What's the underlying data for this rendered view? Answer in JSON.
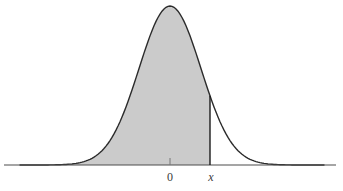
{
  "figure": {
    "width": 343,
    "height": 191,
    "background": "#ffffff"
  },
  "chart_data": {
    "type": "area",
    "title": "",
    "curve": "normal-density",
    "x_axis": {
      "tick_labels": [
        "0",
        "x"
      ],
      "axis_line_shown": true,
      "y_axis_shown": false,
      "grid": false
    },
    "shaded_region": {
      "from": "-infinity",
      "to": "x",
      "fill": "#cbcbcb"
    },
    "annotations": [
      {
        "label": "0",
        "role": "mean-tick-label"
      },
      {
        "label": "x",
        "role": "cutoff-label",
        "marker": "vertical-line-to-curve"
      }
    ],
    "style": {
      "curve_stroke": "#2b2b2b",
      "curve_stroke_width": 1.4,
      "axis_stroke": "#4d4d4d",
      "axis_stroke_width": 1.1,
      "tick_stroke": "#777777",
      "cutoff_stroke": "#1c1c1c",
      "cutoff_stroke_width": 1.4,
      "label_color": "#3a3a3a"
    },
    "geometry_px": {
      "mean_x": 170,
      "sigma": 31,
      "peak_top_y": 6,
      "baseline_y": 165,
      "cutoff_x": 210,
      "axis_x1": 4,
      "axis_x2": 336,
      "curve_x1": 20,
      "curve_x2": 324,
      "tick_top_y": 158,
      "label_y": 181,
      "zero_label_x": 170,
      "x_label_x": 211
    }
  },
  "labels": {
    "zero": "0",
    "x": "x"
  }
}
